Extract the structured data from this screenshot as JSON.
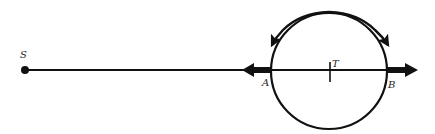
{
  "diagram": {
    "labels": {
      "source": "S",
      "center": "T",
      "left_point": "A",
      "right_point": "B"
    },
    "colors": {
      "stroke": "#111111",
      "background": "#ffffff"
    },
    "elements": [
      "source point S with a line extending right to the circle",
      "circle centered at T with diameter AB along the line",
      "thick arrow at A pointing left",
      "thick arrow at B pointing right",
      "curved arrows on upper arc pointing outward toward A and B"
    ]
  }
}
